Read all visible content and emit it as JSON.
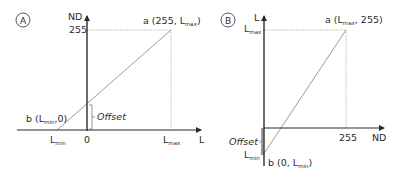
{
  "panels": [
    {
      "id": "A",
      "badge": "A",
      "y_axis_label": "ND",
      "x_axis_label": "L",
      "y_tick_255": "255",
      "x_tick_lmin": {
        "main": "L",
        "sub": "min"
      },
      "x_tick_zero": "0",
      "x_tick_lmax": {
        "main": "L",
        "sub": "max"
      },
      "point_a": {
        "prefix": "a (255, L",
        "sub": "max",
        "suffix": ")"
      },
      "point_b": {
        "prefix": "b (L",
        "sub": "min",
        "suffix": ",0)"
      },
      "offset_label": "Offset"
    },
    {
      "id": "B",
      "badge": "B",
      "y_axis_label": "L",
      "x_axis_label": "ND",
      "y_tick_lmax": {
        "main": "L",
        "sub": "max"
      },
      "y_tick_lmin": {
        "main": "L",
        "sub": "min"
      },
      "x_tick_255": "255",
      "point_a": {
        "prefix": "a (L",
        "sub": "max",
        "suffix": ", 255)"
      },
      "point_b": {
        "prefix": "b (0, L",
        "sub": "min",
        "suffix": ")"
      },
      "offset_label": "Offset"
    }
  ],
  "colors": {
    "axis": "#2b2b2b",
    "line": "#555555",
    "dotted": "#888888",
    "offset_bar": "#9a9a9a"
  }
}
